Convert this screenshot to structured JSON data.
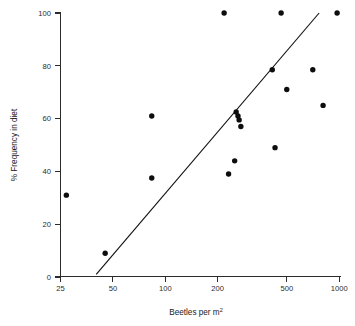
{
  "chart_data": {
    "type": "scatter",
    "title": "",
    "xlabel": "Beetles per m²",
    "ylabel": "% Frequency in diet",
    "xscale": "log",
    "yscale": "linear",
    "xlim": [
      25,
      1000
    ],
    "ylim": [
      0,
      100
    ],
    "grid": false,
    "legend": null,
    "xticks": [
      25,
      50,
      100,
      200,
      500,
      1000
    ],
    "xtick_labels": [
      "25",
      "50",
      "100",
      "200",
      "500",
      "1000"
    ],
    "yticks": [
      0,
      20,
      40,
      60,
      80,
      100
    ],
    "ytick_labels": [
      "0",
      "20",
      "40",
      "60",
      "80",
      "100"
    ],
    "points": [
      {
        "x": 27,
        "y": 31
      },
      {
        "x": 45,
        "y": 9
      },
      {
        "x": 83,
        "y": 37.5
      },
      {
        "x": 83,
        "y": 61
      },
      {
        "x": 215,
        "y": 100
      },
      {
        "x": 228,
        "y": 39
      },
      {
        "x": 247,
        "y": 44
      },
      {
        "x": 252,
        "y": 62.5
      },
      {
        "x": 258,
        "y": 61
      },
      {
        "x": 262,
        "y": 59.5
      },
      {
        "x": 268,
        "y": 57
      },
      {
        "x": 405,
        "y": 78.5
      },
      {
        "x": 420,
        "y": 49
      },
      {
        "x": 455,
        "y": 100
      },
      {
        "x": 490,
        "y": 71
      },
      {
        "x": 690,
        "y": 78.5
      },
      {
        "x": 790,
        "y": 65
      },
      {
        "x": 950,
        "y": 100
      }
    ],
    "fit_line": {
      "label": "regression line",
      "x_start": 40,
      "y_start": 1,
      "x_end": 750,
      "y_end": 100
    }
  },
  "axes": {
    "y_axis_label": "% Frequency in diet",
    "x_axis_label_main": "Beetles per m",
    "x_axis_label_exponent": "2"
  }
}
